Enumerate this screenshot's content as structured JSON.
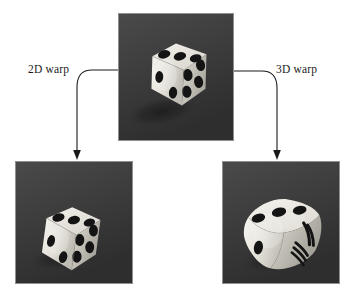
{
  "figure": {
    "kind": "image-warping-diagram",
    "background_color": "#ffffff",
    "line_color": "#1a1a1a"
  },
  "labels": {
    "warp_2d": "2D warp",
    "warp_3d": "3D warp"
  },
  "panels": [
    {
      "id": "source",
      "role": "source-image",
      "subject": "die",
      "background_color": "#3a3a3a",
      "border_color": "#8f8f8f",
      "die_body_color": "#e8e6e0",
      "pip_color": "#141414",
      "shadow_color": "#242424"
    },
    {
      "id": "warp2d",
      "role": "2d-warped-image",
      "subject": "die",
      "background_color": "#3a3a3a",
      "border_color": "#8f8f8f",
      "die_body_color": "#e8e6e0",
      "pip_color": "#141414",
      "shadow_color": "#242424"
    },
    {
      "id": "warp3d",
      "role": "3d-warped-image",
      "subject": "die",
      "background_color": "#3a3a3a",
      "border_color": "#8f8f8f",
      "die_body_color": "#e8e6e0",
      "pip_color": "#141414",
      "shadow_color": "#242424"
    }
  ],
  "arrows": [
    {
      "id": "arrow-2d",
      "from": "source",
      "to": "warp2d",
      "label": "2D warp"
    },
    {
      "id": "arrow-3d",
      "from": "source",
      "to": "warp3d",
      "label": "3D warp"
    }
  ]
}
